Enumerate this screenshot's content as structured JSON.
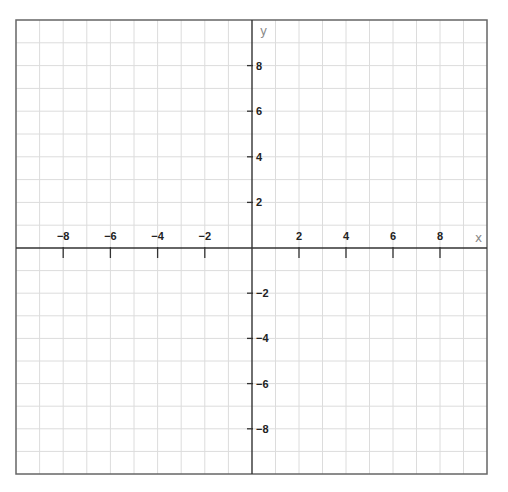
{
  "chart_data": {
    "type": "line",
    "title": "",
    "xlabel": "x",
    "ylabel": "y",
    "xlim": [
      -10,
      10
    ],
    "ylim": [
      -10,
      10
    ],
    "grid": true,
    "grid_step": 1,
    "x_ticks": [
      -8,
      -6,
      -4,
      -2,
      2,
      4,
      6,
      8
    ],
    "y_ticks": [
      8,
      6,
      4,
      2,
      -2,
      -4,
      -6,
      -8
    ],
    "x_tick_labels": [
      "−8",
      "−6",
      "−4",
      "−2",
      "2",
      "4",
      "6",
      "8"
    ],
    "y_tick_labels": [
      "8",
      "6",
      "4",
      "2",
      "−2",
      "−4",
      "−6",
      "−8"
    ],
    "series": []
  },
  "colors": {
    "grid": "#dcdcdc",
    "axis": "#333333",
    "frame": "#666666",
    "tick_label": "#222222",
    "axis_label": "#888888"
  },
  "layout": {
    "frame": {
      "left": 16,
      "top": 20,
      "right": 487,
      "bottom": 474
    },
    "origin": {
      "x": 252,
      "y": 248
    }
  }
}
